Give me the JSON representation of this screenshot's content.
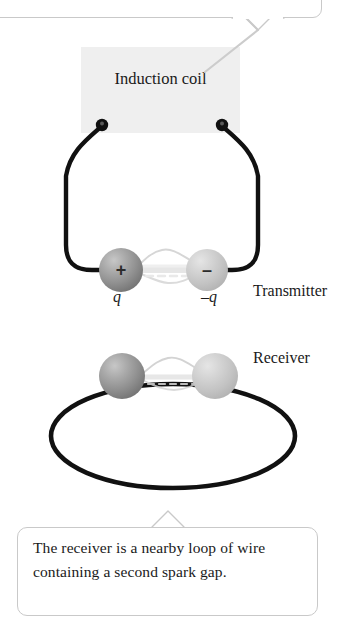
{
  "figure": {
    "top_callout": {
      "text": "spark gap.",
      "note": "clipped at top edge of screenshot"
    },
    "bottom_callout": {
      "text": "The receiver is a nearby loop of wire containing a second spark gap."
    },
    "induction_coil": {
      "label": "Induction coil"
    },
    "transmitter": {
      "label": "Transmitter",
      "positive_sphere_sign": "+",
      "negative_sphere_sign": "–",
      "positive_charge_label": "q",
      "negative_charge_label": "–q"
    },
    "receiver": {
      "label": "Receiver"
    },
    "colors": {
      "coil_box_fill": "#efefef",
      "callout_border": "#c9c9c9",
      "wire": "#1a1a1a",
      "leader_line": "#cccccc",
      "spark": "#d8d8d8",
      "sphere_dark": "#8f8f8f",
      "sphere_light": "#c2c2c2",
      "background": "#ffffff"
    }
  }
}
